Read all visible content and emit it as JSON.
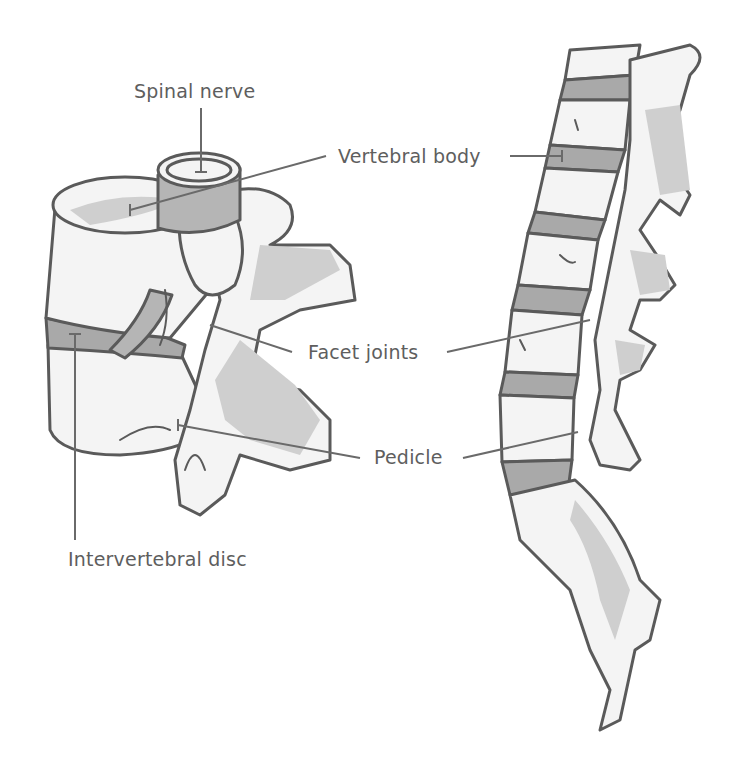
{
  "diagram": {
    "type": "anatomical-illustration",
    "colors": {
      "background": "#ffffff",
      "outline": "#5a5a5a",
      "bone_fill": "#f4f4f4",
      "shadow": "#cfcfcf",
      "disc": "#a9a9a9",
      "label_text": "#5e5e5e"
    },
    "labels": {
      "spinal_nerve": "Spinal nerve",
      "vertebral_body": "Vertebral body",
      "facet_joints": "Facet joints",
      "pedicle": "Pedicle",
      "intervertebral_disc": "Intervertebral disc"
    }
  }
}
